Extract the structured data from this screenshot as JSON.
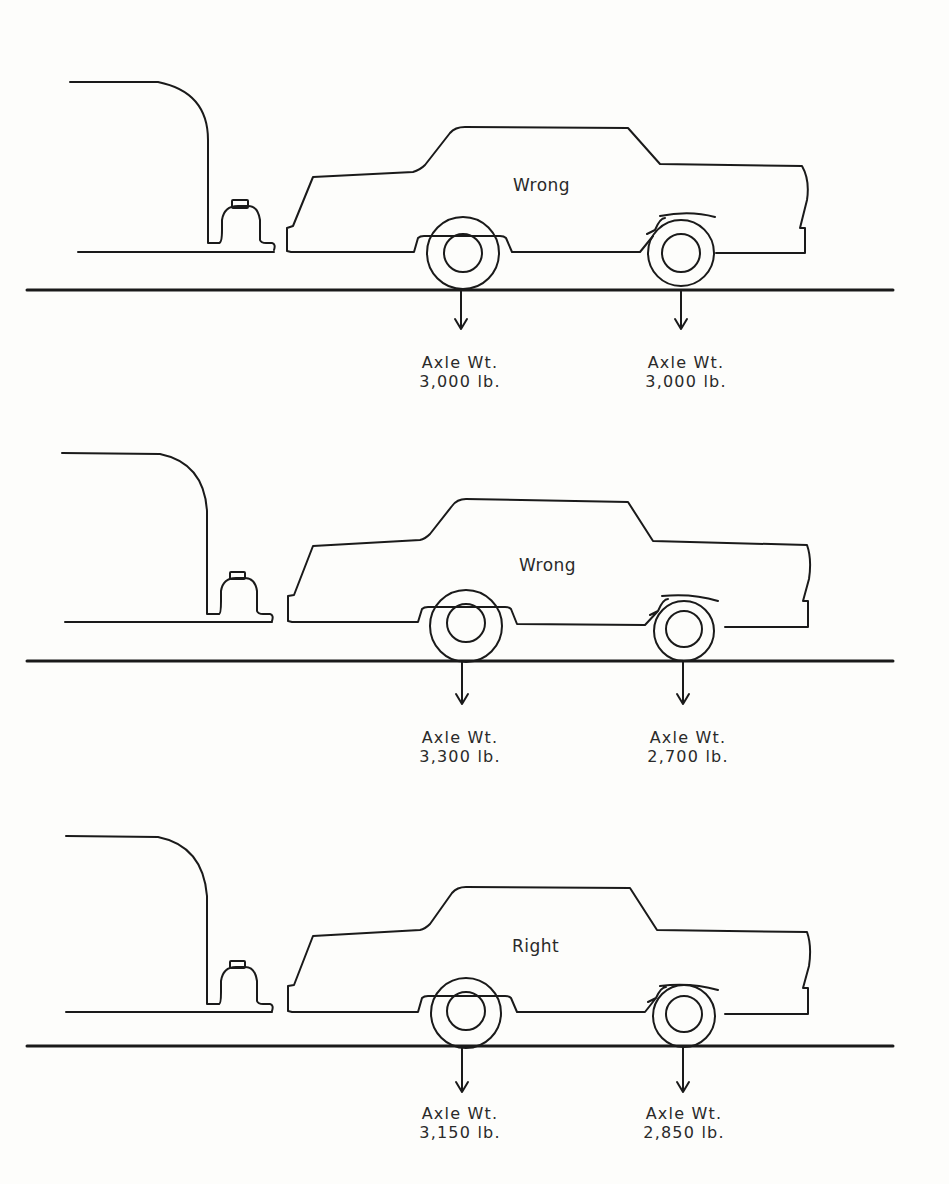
{
  "panels": [
    {
      "verdict": "Wrong",
      "rear_axle": {
        "label": "Axle Wt.",
        "weight": "3,000 lb."
      },
      "front_axle": {
        "label": "Axle Wt.",
        "weight": "3,000 lb."
      }
    },
    {
      "verdict": "Wrong",
      "rear_axle": {
        "label": "Axle Wt.",
        "weight": "3,300 lb."
      },
      "front_axle": {
        "label": "Axle Wt.",
        "weight": "2,700 lb."
      }
    },
    {
      "verdict": "Right",
      "rear_axle": {
        "label": "Axle Wt.",
        "weight": "3,150 lb."
      },
      "front_axle": {
        "label": "Axle Wt.",
        "weight": "2,850 lb."
      }
    }
  ],
  "colors": {
    "background": "#fdfdfb",
    "line": "#1a1a1a",
    "text": "#2a2a2a"
  }
}
